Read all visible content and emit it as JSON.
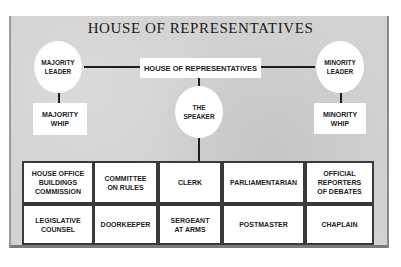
{
  "title": "HOUSE OF REPRESENTATIVES",
  "top_box": "HOUSE OF REPRESENTATIVES",
  "majority_leader": "MAJORITY\nLEADER",
  "majority_whip": "MAJORITY\nWHIP",
  "minority_leader": "MINORITY\nLEADER",
  "minority_whip": "MINORITY\nWHIP",
  "speaker": "THE\nSPEAKER",
  "offices": {
    "row1": [
      "HOUSE OFFICE\nBUILDINGS\nCOMMISSION",
      "COMMITTEE\nON RULES",
      "CLERK",
      "PARLIAMENTARIAN",
      "OFFICIAL\nREPORTERS\nOF DEBATES"
    ],
    "row2": [
      "LEGISLATIVE\nCOUNSEL",
      "DOORKEEPER",
      "SERGEANT\nAT ARMS",
      "POSTMASTER",
      "CHAPLAIN"
    ]
  },
  "colors": {
    "panel": "#d2d2d2",
    "node": "#ffffff",
    "line": "#1e1e1e",
    "text": "#222222"
  }
}
